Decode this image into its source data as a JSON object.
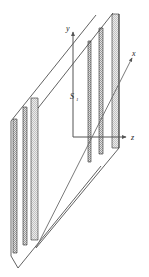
{
  "figure": {
    "background_color": "#ffffff",
    "line_color": "#3a3a3a",
    "axis_color": "#555555",
    "strip_fill": "#cfcfcf",
    "strip_edge": "#2b2b2b"
  },
  "axes": {
    "x": {
      "label": "x",
      "direction": "upper-right-oblique"
    },
    "y": {
      "label": "y",
      "direction": "up"
    },
    "z": {
      "label": "z",
      "direction": "right"
    },
    "origin_label": ""
  },
  "labels": {
    "source": {
      "base": "S",
      "subscript": "1"
    }
  },
  "planes": [
    {
      "name": "far-plane",
      "strip_count": 3,
      "strips": [
        "slit-strip-1",
        "slit-strip-2",
        "slit-strip-3"
      ]
    },
    {
      "name": "near-plane",
      "strip_count": 3,
      "strips": [
        "slit-strip-1",
        "slit-strip-2",
        "slit-strip-3"
      ]
    }
  ]
}
